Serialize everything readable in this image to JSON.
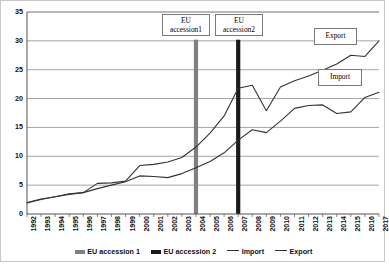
{
  "chart_data": {
    "type": "line",
    "title": "",
    "xlabel": "",
    "ylabel": "",
    "xlim": [
      1992,
      2017
    ],
    "ylim": [
      0,
      35
    ],
    "y_ticks": [
      0,
      5,
      10,
      15,
      20,
      25,
      30,
      35
    ],
    "grid": "horizontal",
    "legend_position": "bottom",
    "categories": [
      "1992",
      "1993",
      "1994",
      "1995",
      "1996",
      "1997",
      "1998",
      "1999",
      "2000",
      "2001",
      "2002",
      "2003",
      "2004",
      "2005",
      "2006",
      "2007",
      "2008",
      "2009",
      "2010",
      "2011",
      "2012",
      "2013",
      "2014",
      "2015",
      "2016",
      "2017"
    ],
    "series": [
      {
        "name": "Import",
        "color": "#333333",
        "values": [
          2.0,
          2.6,
          3.0,
          3.4,
          3.7,
          4.4,
          5.0,
          5.6,
          6.6,
          6.5,
          6.3,
          7.0,
          8.0,
          9.1,
          10.6,
          12.8,
          14.6,
          14.1,
          16.1,
          18.3,
          18.8,
          18.9,
          17.4,
          17.7,
          20.2,
          21.1
        ]
      },
      {
        "name": "Export",
        "color": "#333333",
        "values": [
          1.9,
          2.5,
          3.0,
          3.5,
          3.7,
          5.3,
          5.4,
          5.7,
          8.4,
          8.6,
          9.0,
          9.8,
          11.6,
          14.0,
          17.0,
          21.8,
          22.3,
          17.9,
          22.0,
          23.1,
          23.9,
          24.9,
          26.0,
          27.5,
          27.3,
          30.0
        ]
      }
    ],
    "event_markers": [
      {
        "name": "EU accession 1",
        "year": "2004",
        "color": "#808080"
      },
      {
        "name": "EU accession 2",
        "year": "2007",
        "color": "#1a1a1a"
      }
    ]
  },
  "annotations": {
    "accession_1_line1": "EU",
    "accession_1_line2": "accession1",
    "accession_2_line1": "EU",
    "accession_2_line2": "accession2",
    "export_label": "Export",
    "import_label": "Import"
  },
  "legend": {
    "items": [
      {
        "label": "EU accession 1",
        "marker": "bar-swatch-gray"
      },
      {
        "label": "EU accession 2",
        "marker": "bar-swatch-black"
      },
      {
        "label": "Import",
        "marker": "line-swatch"
      },
      {
        "label": "Export",
        "marker": "line-swatch"
      }
    ]
  }
}
